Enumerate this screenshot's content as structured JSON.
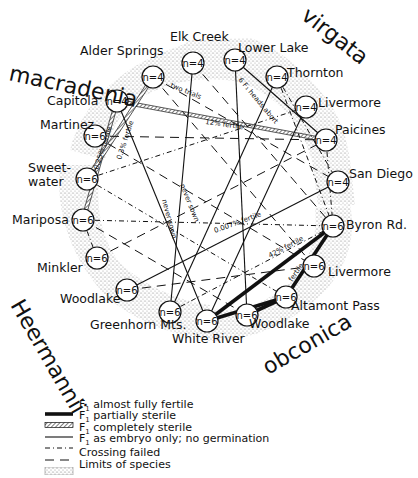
{
  "species": [
    {
      "name": "macradenia",
      "x": 8,
      "y": 80,
      "rotate": 12,
      "size": 22
    },
    {
      "name": "virgata",
      "x": 300,
      "y": 18,
      "rotate": 38,
      "size": 22
    },
    {
      "name": "Heermannii",
      "x": 10,
      "y": 305,
      "rotate": 60,
      "size": 22
    },
    {
      "name": "obconica",
      "x": 268,
      "y": 375,
      "rotate": -30,
      "size": 22
    }
  ],
  "nodes": [
    {
      "id": "alder-springs",
      "label": "Alder Springs",
      "n": "n=4",
      "cx": 153,
      "cy": 77,
      "lx": 80,
      "ly": 55
    },
    {
      "id": "elk-creek",
      "label": "Elk Creek",
      "n": "n=4",
      "cx": 193,
      "cy": 63,
      "lx": 170,
      "ly": 41
    },
    {
      "id": "lower-lake",
      "label": "Lower Lake",
      "n": "n=4",
      "cx": 235,
      "cy": 60,
      "lx": 238,
      "ly": 52
    },
    {
      "id": "thornton",
      "label": "Thornton",
      "n": "n=4",
      "cx": 277,
      "cy": 77,
      "lx": 287,
      "ly": 77
    },
    {
      "id": "livermore-virgata",
      "label": "Livermore",
      "n": "n=4",
      "cx": 306,
      "cy": 107,
      "lx": 318,
      "ly": 107
    },
    {
      "id": "paicines",
      "label": "Paicines",
      "n": "n=4",
      "cx": 326,
      "cy": 140,
      "lx": 335,
      "ly": 134
    },
    {
      "id": "san-diego",
      "label": "San Diego",
      "n": "n=4",
      "cx": 338,
      "cy": 182,
      "lx": 349,
      "ly": 178
    },
    {
      "id": "byron-rd",
      "label": "Byron Rd.",
      "n": "n=6",
      "cx": 333,
      "cy": 226,
      "lx": 346,
      "ly": 229
    },
    {
      "id": "livermore-obconica",
      "label": "Livermore",
      "n": "n=6",
      "cx": 314,
      "cy": 266,
      "lx": 328,
      "ly": 276
    },
    {
      "id": "altamont-pass",
      "label": "Altamont Pass",
      "n": "n=6",
      "cx": 286,
      "cy": 297,
      "lx": 291,
      "ly": 310
    },
    {
      "id": "woodlake-obconica",
      "label": "Woodlake",
      "n": "n=6",
      "cx": 247,
      "cy": 315,
      "lx": 249,
      "ly": 328
    },
    {
      "id": "white-river",
      "label": "White River",
      "n": "n=6",
      "cx": 207,
      "cy": 321,
      "lx": 172,
      "ly": 343
    },
    {
      "id": "greenhorn-mts",
      "label": "Greenhorn Mts.",
      "n": "n=6",
      "cx": 170,
      "cy": 312,
      "lx": 90,
      "ly": 329
    },
    {
      "id": "woodlake-heermannii",
      "label": "Woodlake",
      "n": "n=6",
      "cx": 127,
      "cy": 290,
      "lx": 60,
      "ly": 303
    },
    {
      "id": "minkler",
      "label": "Minkler",
      "n": "n=6",
      "cx": 97,
      "cy": 258,
      "lx": 37,
      "ly": 272
    },
    {
      "id": "mariposa",
      "label": "Mariposa",
      "n": "n=6",
      "cx": 83,
      "cy": 220,
      "lx": 12,
      "ly": 224
    },
    {
      "id": "sweetwater",
      "label": "Sweet-\nwater",
      "n": "n=6",
      "cx": 87,
      "cy": 179,
      "lx": 28,
      "ly": 172
    },
    {
      "id": "martinez",
      "label": "Martinez",
      "n": "n=6",
      "cx": 95,
      "cy": 136,
      "lx": 40,
      "ly": 129
    },
    {
      "id": "capitola",
      "label": "Capitola",
      "n": "n=4",
      "cx": 117,
      "cy": 101,
      "lx": 47,
      "ly": 105
    }
  ],
  "edges": [
    {
      "from": "capitola",
      "to": "paicines",
      "type": "partial",
      "annotation": "12% fertile"
    },
    {
      "from": "capitola",
      "to": "mariposa",
      "type": "partial",
      "annotation": "0.25% fertile"
    },
    {
      "from": "alder-springs",
      "to": "sweetwater",
      "type": "partial",
      "annotation": "0.3% fertile"
    },
    {
      "from": "byron-rd",
      "to": "white-river",
      "type": "fertile",
      "annotation": "42% fertile"
    },
    {
      "from": "byron-rd",
      "to": "altamont-pass",
      "type": "fertile",
      "annotation": "fertile"
    },
    {
      "from": "altamont-pass",
      "to": "white-river",
      "type": "fertile",
      "annotation": ""
    },
    {
      "from": "altamont-pass",
      "to": "woodlake-obconica",
      "type": "fertile",
      "annotation": ""
    },
    {
      "from": "san-diego",
      "to": "woodlake-heermannii",
      "type": "sterile",
      "annotation": "0.007% fertile"
    },
    {
      "from": "lower-lake",
      "to": "paicines",
      "type": "sterile",
      "annotation": "6 F1 heads abort"
    },
    {
      "from": "elk-creek",
      "to": "greenhorn-mts",
      "type": "sterile",
      "annotation": "never sown"
    },
    {
      "from": "capitola",
      "to": "white-river",
      "type": "sterile",
      "annotation": "never sown"
    },
    {
      "from": "alder-springs",
      "to": "san-diego",
      "type": "crossfail",
      "annotation": "two trials"
    },
    {
      "from": "thornton",
      "to": "greenhorn-mts",
      "type": "sterile",
      "annotation": ""
    },
    {
      "from": "livermore-virgata",
      "to": "white-river",
      "type": "sterile",
      "annotation": ""
    },
    {
      "from": "elk-creek",
      "to": "byron-rd",
      "type": "crossfail",
      "annotation": ""
    },
    {
      "from": "martinez",
      "to": "paicines",
      "type": "crossfail",
      "annotation": ""
    },
    {
      "from": "sweetwater",
      "to": "livermore-virgata",
      "type": "embryo",
      "annotation": ""
    },
    {
      "from": "mariposa",
      "to": "byron-rd",
      "type": "embryo",
      "annotation": ""
    },
    {
      "from": "martinez",
      "to": "livermore-obconica",
      "type": "crossfail",
      "annotation": ""
    },
    {
      "from": "sweetwater",
      "to": "altamont-pass",
      "type": "embryo",
      "annotation": ""
    },
    {
      "from": "mariposa",
      "to": "woodlake-obconica",
      "type": "crossfail",
      "annotation": ""
    },
    {
      "from": "minkler",
      "to": "paicines",
      "type": "crossfail",
      "annotation": ""
    },
    {
      "from": "thornton",
      "to": "byron-rd",
      "type": "embryo",
      "annotation": ""
    },
    {
      "from": "lower-lake",
      "to": "woodlake-obconica",
      "type": "sterile",
      "annotation": ""
    },
    {
      "from": "alder-springs",
      "to": "livermore-obconica",
      "type": "crossfail",
      "annotation": ""
    },
    {
      "from": "woodlake-heermannii",
      "to": "livermore-obconica",
      "type": "crossfail",
      "annotation": ""
    },
    {
      "from": "greenhorn-mts",
      "to": "byron-rd",
      "type": "embryo",
      "annotation": ""
    },
    {
      "from": "mariposa",
      "to": "minkler",
      "type": "embryo",
      "annotation": ""
    },
    {
      "from": "paicines",
      "to": "byron-rd",
      "type": "embryo",
      "annotation": ""
    },
    {
      "from": "thornton",
      "to": "san-diego",
      "type": "embryo",
      "annotation": ""
    }
  ],
  "line_styles": {
    "fertile": {
      "width": 3.6,
      "dash": ""
    },
    "partial": {
      "width": 3.2,
      "dash": ""
    },
    "sterile": {
      "width": 1.1,
      "dash": ""
    },
    "embryo": {
      "width": 1.0,
      "dash": "5 3 1 3"
    },
    "crossfail": {
      "width": 1.0,
      "dash": "9 6"
    }
  },
  "colors": {
    "ink": "#111111",
    "stipple": "#9a9a9a",
    "background": "#ffffff"
  },
  "legend": [
    {
      "key": "fertile",
      "prefix": "F",
      "sub": "1",
      "text": " almost fully fertile"
    },
    {
      "key": "partial",
      "prefix": "F",
      "sub": "1",
      "text": " partially sterile"
    },
    {
      "key": "sterile",
      "prefix": "F",
      "sub": "1",
      "text": " completely sterile"
    },
    {
      "key": "embryo",
      "prefix": "F",
      "sub": "1",
      "text": " as embryo only; no germination"
    },
    {
      "key": "crossfail",
      "prefix": "",
      "sub": "",
      "text": "Crossing failed"
    },
    {
      "key": "limits",
      "prefix": "",
      "sub": "",
      "text": "Limits of species"
    }
  ]
}
